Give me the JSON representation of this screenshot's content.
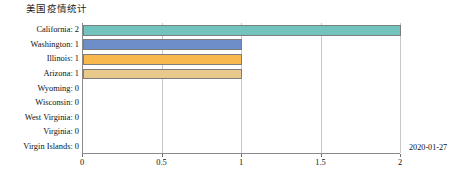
{
  "chart_data": {
    "type": "bar",
    "orientation": "horizontal",
    "title": "美国疫情统计",
    "xlabel": "",
    "ylabel": "",
    "xlim": [
      0,
      2
    ],
    "ylim": null,
    "grid": true,
    "legend": false,
    "annotation": "2020-01-27",
    "xticks": [
      "0",
      "0.5",
      "1",
      "1.5",
      "2"
    ],
    "xtick_values": [
      0,
      0.5,
      1,
      1.5,
      2
    ],
    "categories": [
      "California",
      "Washington",
      "Illinois",
      "Arizona",
      "Wyoming",
      "Wisconsin",
      "West Virginia",
      "Virginia",
      "Virgin Islands"
    ],
    "values": [
      2,
      1,
      1,
      1,
      0,
      0,
      0,
      0,
      0
    ],
    "ytick_labels": [
      "California: 2",
      "Washington: 1",
      "Illinois: 1",
      "Arizona: 1",
      "Wyoming: 0",
      "Wisconsin: 0",
      "West Virginia: 0",
      "Virginia: 0",
      "Virgin Islands: 0"
    ],
    "bar_colors": [
      "#72c2bd",
      "#6d8ec9",
      "#f8b84e",
      "#e9c98b",
      "#ffffff",
      "#ffffff",
      "#ffffff",
      "#ffffff",
      "#ffffff"
    ],
    "bar_edge_color": "#7d7d7d",
    "grid_color": "#c8c8c8",
    "axis_color": "#8a8a8a",
    "background": "#ffffff"
  }
}
